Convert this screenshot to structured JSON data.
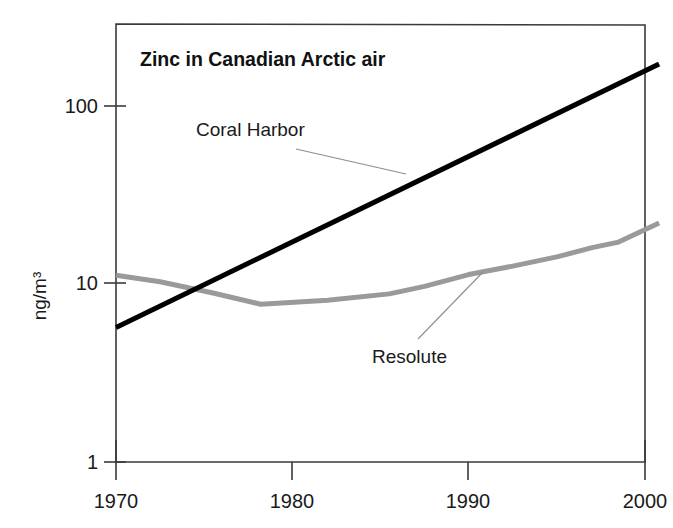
{
  "chart_data": {
    "type": "line",
    "title": "Zinc in Canadian Arctic air",
    "xlabel": "",
    "ylabel": "ng/m3",
    "ylabel_display": "ng/m³",
    "yscale": "log",
    "ylim": [
      1,
      300
    ],
    "xlim": [
      1970,
      2001
    ],
    "grid": false,
    "legend_position": "inline-annotations",
    "x_ticks": [
      "1970",
      "1980",
      "1990",
      "2000"
    ],
    "x_tick_values": [
      1970,
      1980,
      1990,
      2000
    ],
    "y_ticks": [
      "100",
      "10",
      "1"
    ],
    "y_tick_values": [
      100,
      10,
      1
    ],
    "series": [
      {
        "name": "Coral Harbor",
        "color": "#000000",
        "linewidth": 5,
        "x": [
          1970,
          2000.8
        ],
        "values": [
          5.7,
          172
        ]
      },
      {
        "name": "Resolute",
        "color": "#9a9a9a",
        "linewidth": 5,
        "x": [
          1970,
          1972.5,
          1975.5,
          1978.2,
          1982.0,
          1985.5,
          1987.5,
          1990.0,
          1992.5,
          1995.0,
          1997.0,
          1998.5,
          2000.8
        ],
        "values": [
          11.2,
          10.3,
          8.9,
          7.7,
          8.1,
          8.8,
          9.7,
          11.3,
          12.6,
          14.2,
          16.0,
          17.2,
          22.0
        ]
      }
    ],
    "annotations": [
      {
        "text": "Coral Harbor",
        "series": "Coral Harbor",
        "label_x": 1970.9,
        "label_y": 53.0
      },
      {
        "text": "Resolute",
        "series": "Resolute",
        "label_x": 1988.0,
        "label_y": 4.4
      }
    ]
  }
}
